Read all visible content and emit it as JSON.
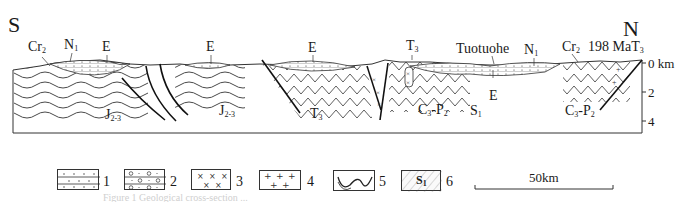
{
  "figure": {
    "direction_left": "S",
    "direction_right": "N",
    "depth_axis": {
      "ticks": [
        {
          "value": "0 km",
          "y": 63
        },
        {
          "value": "2",
          "y": 92
        },
        {
          "value": "4",
          "y": 121
        }
      ]
    },
    "surface_labels": [
      {
        "id": "cr2-left",
        "base": "Cr",
        "sub": "2"
      },
      {
        "id": "n1-left",
        "base": "N",
        "sub": "1"
      },
      {
        "id": "e-1",
        "base": "E",
        "sub": ""
      },
      {
        "id": "e-2",
        "base": "E",
        "sub": ""
      },
      {
        "id": "e-3",
        "base": "E",
        "sub": ""
      },
      {
        "id": "t3-mid",
        "base": "T",
        "sub": "3"
      },
      {
        "id": "tuotuohe",
        "base": "Tuotuohe",
        "sub": ""
      },
      {
        "id": "n1-right",
        "base": "N",
        "sub": "1"
      },
      {
        "id": "cr2-right",
        "base": "Cr",
        "sub": "2"
      },
      {
        "id": "age",
        "base": "198 MaT",
        "sub": "3"
      }
    ],
    "unit_labels": [
      {
        "id": "j23-left",
        "base": "J",
        "sub": "2-3"
      },
      {
        "id": "j23-mid",
        "base": "J",
        "sub": "2-3"
      },
      {
        "id": "t3-fold",
        "base": "T",
        "sub": "3"
      },
      {
        "id": "c3p2-mid",
        "base": "C",
        "sub": "3",
        "tail": "-P",
        "sub2": "2"
      },
      {
        "id": "s1",
        "base": "S",
        "sub": "1"
      },
      {
        "id": "e-lower",
        "base": "E",
        "sub": ""
      },
      {
        "id": "c3p2-right",
        "base": "C",
        "sub": "3",
        "tail": "-P",
        "sub2": "2"
      }
    ]
  },
  "legend": {
    "items": [
      {
        "num": "1",
        "symbol": "dotted-layers-icon",
        "meaning": "sandstone"
      },
      {
        "num": "2",
        "symbol": "conglomerate-icon",
        "meaning": "conglomerate"
      },
      {
        "num": "3",
        "symbol": "cross-pattern-icon",
        "meaning": "intermediate intrusion"
      },
      {
        "num": "4",
        "symbol": "plus-pattern-icon",
        "meaning": "granite"
      },
      {
        "num": "5",
        "symbol": "fold-icon",
        "meaning": "folded strata"
      },
      {
        "num": "6",
        "symbol": "hatched-s1-icon",
        "meaning": "stratum code",
        "inner_label_base": "S",
        "inner_label_sub": "1"
      }
    ],
    "scale_bar": "50km"
  },
  "caption": "Figure 1  Geological cross-section ..."
}
